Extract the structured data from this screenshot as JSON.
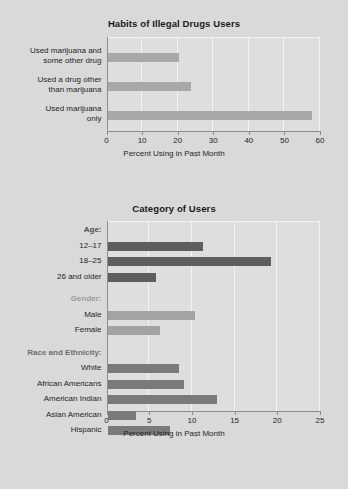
{
  "background_color": "#d9d9d9",
  "plot_background_color": "#dedede",
  "charts": [
    {
      "name": "habits-chart",
      "title": "Habits of Illegal Drugs Users",
      "xlabel": "Percent Using in Past Month",
      "ticks": [
        "0",
        "10",
        "20",
        "30",
        "40",
        "50",
        "60"
      ]
    },
    {
      "name": "category-chart",
      "title": "Category of Users",
      "xlabel": "Percent Using in Past Month",
      "ticks": [
        "0",
        "5",
        "10",
        "15",
        "20",
        "25"
      ]
    }
  ],
  "chart_data": [
    {
      "type": "bar",
      "orientation": "horizontal",
      "title": "Habits of Illegal Drugs Users",
      "xlabel": "Percent Using in Past Month",
      "ylabel": "",
      "xlim": [
        0,
        60
      ],
      "xticks": [
        0,
        10,
        20,
        30,
        40,
        50,
        60
      ],
      "grid": true,
      "legend": "none",
      "bar_color": "#a8a8a8",
      "categories": [
        "Used marijuana and some other drug",
        "Used a drug other than marijuana",
        "Used marijuana only"
      ],
      "values": [
        20.0,
        23.5,
        57.5
      ]
    },
    {
      "type": "bar",
      "orientation": "horizontal",
      "title": "Category of Users",
      "xlabel": "Percent Using in Past Month",
      "ylabel": "",
      "xlim": [
        0,
        25
      ],
      "xticks": [
        0,
        5,
        10,
        15,
        20,
        25
      ],
      "grid": true,
      "legend": "none",
      "groups": [
        {
          "label": "Age:",
          "label_color": "#4d4d4d",
          "bar_color": "#5e5e5e",
          "categories": [
            "12–17",
            "18–25",
            "26 and older"
          ],
          "values": [
            11.2,
            19.1,
            5.7
          ]
        },
        {
          "label": "Gender:",
          "label_color": "#9a9a9a",
          "bar_color": "#a3a3a3",
          "categories": [
            "Male",
            "Female"
          ],
          "values": [
            10.3,
            6.1
          ]
        },
        {
          "label": "Race and Ethnicity:",
          "label_color": "#6e6e6e",
          "bar_color": "#7a7a7a",
          "categories": [
            "White",
            "African Americans",
            "American Indian",
            "Asian American",
            "Hispanic"
          ],
          "values": [
            8.4,
            9.0,
            12.8,
            3.3,
            7.3
          ]
        }
      ]
    }
  ]
}
